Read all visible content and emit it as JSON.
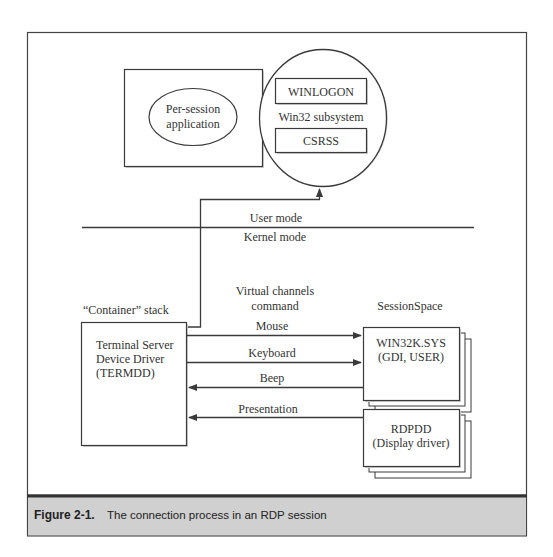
{
  "figure": {
    "label": "Figure 2-1.",
    "caption": "The connection process in an RDP session"
  },
  "user_space": {
    "app_box": {
      "ellipse_label_line1": "Per-session",
      "ellipse_label_line2": "application"
    },
    "win32_subsystem": {
      "label": "Win32 subsystem",
      "winlogon": "WINLOGON",
      "csrss": "CSRSS"
    }
  },
  "modes": {
    "user": "User mode",
    "kernel": "Kernel mode"
  },
  "kernel_space": {
    "virtual_channels_line1": "Virtual channels",
    "virtual_channels_line2": "command",
    "container_stack": "“Container” stack",
    "termdd": {
      "line1": "Terminal Server",
      "line2": "Device Driver",
      "line3": "(TERMDD)"
    },
    "session_space": "SessionSpace",
    "win32k": {
      "line1": "WIN32K.SYS",
      "line2": "(GDI, USER)"
    },
    "rdpdd": {
      "line1": "RDPDD",
      "line2": "(Display driver)"
    },
    "arrows": [
      {
        "label": "Mouse",
        "direction": "right"
      },
      {
        "label": "Keyboard",
        "direction": "right"
      },
      {
        "label": "Beep",
        "direction": "left"
      },
      {
        "label": "Presentation",
        "direction": "left"
      }
    ]
  },
  "colors": {
    "line": "#3a3a3a",
    "caption_bg": "#d0d0d0",
    "caption_border": "#333333",
    "shadow": "#bbbbbb"
  }
}
